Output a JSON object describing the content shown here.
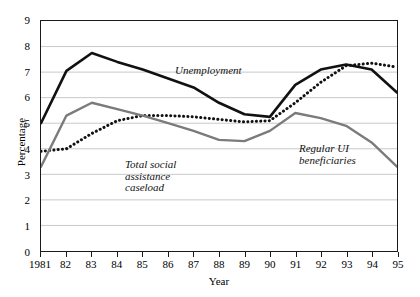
{
  "chart_data": {
    "type": "line",
    "title": "",
    "xlabel": "Year",
    "ylabel": "Percentage",
    "x": [
      1981,
      1982,
      1983,
      1984,
      1985,
      1986,
      1987,
      1988,
      1989,
      1990,
      1991,
      1992,
      1993,
      1994,
      1995
    ],
    "categories": [
      "1981",
      "82",
      "83",
      "84",
      "85",
      "86",
      "87",
      "88",
      "89",
      "90",
      "91",
      "92",
      "93",
      "94",
      "95"
    ],
    "ylim": [
      0,
      9
    ],
    "yticks": [
      0,
      1,
      2,
      3,
      4,
      5,
      6,
      7,
      8,
      9
    ],
    "ytick_labels": [
      "0",
      "1",
      "2",
      "3",
      "4",
      "5",
      "6",
      "7",
      "8",
      "9"
    ],
    "grid": true,
    "grid_axis": "y",
    "legend": "inline-annotations",
    "series": [
      {
        "name": "Unemployment",
        "style": "solid",
        "color": "#111111",
        "width": 2.6,
        "values": [
          5.0,
          7.05,
          7.75,
          7.4,
          7.1,
          6.75,
          6.4,
          5.8,
          5.35,
          5.25,
          6.5,
          7.1,
          7.3,
          7.1,
          6.2
        ]
      },
      {
        "name": "Total social assistance caseload",
        "style": "dotted",
        "color": "#111111",
        "width": 3.0,
        "values": [
          3.9,
          4.0,
          4.6,
          5.1,
          5.3,
          5.3,
          5.25,
          5.15,
          5.05,
          5.1,
          5.8,
          6.6,
          7.25,
          7.35,
          7.2
        ]
      },
      {
        "name": "Regular UI beneficiaries",
        "style": "solid",
        "color": "#7b7b7b",
        "width": 2.4,
        "values": [
          3.3,
          5.3,
          5.8,
          5.55,
          5.3,
          5.0,
          4.7,
          4.35,
          4.3,
          4.7,
          5.4,
          5.2,
          4.9,
          4.25,
          3.3
        ]
      }
    ],
    "annotations": [
      {
        "text": "Unemployment",
        "series": "Unemployment"
      },
      {
        "text": "Total social\nassistance\ncaseload",
        "series": "Total social assistance caseload"
      },
      {
        "text": "Regular UI\nbeneficiaries",
        "series": "Regular UI beneficiaries"
      }
    ]
  },
  "axes": {
    "y_title": "Percentage",
    "x_title": "Year"
  },
  "annotation_text": {
    "unemployment": "Unemployment",
    "social_assistance": "Total social\nassistance\ncaseload",
    "ui_beneficiaries": "Regular UI\nbeneficiaries"
  },
  "colors": {
    "unemployment": "#111111",
    "social_assistance": "#111111",
    "ui_beneficiaries": "#7b7b7b",
    "grid": "#c9c9c9",
    "frame": "#1a1a1a"
  }
}
